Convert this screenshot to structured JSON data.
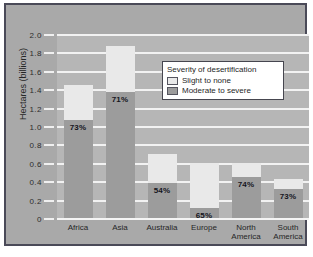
{
  "chart_data": {
    "type": "bar",
    "subtype": "stacked-bar",
    "title": "",
    "xlabel": "",
    "ylabel": "Hectares (billions)",
    "ylim": [
      0,
      2.0
    ],
    "ytick_values": [
      2.0,
      1.8,
      1.6,
      1.4,
      1.2,
      1.0,
      0.8,
      0.6,
      0.4,
      0.2,
      0
    ],
    "ytick_labels": [
      "2.0",
      "1.8",
      "1.6",
      "1.4",
      "1.2",
      "1.0",
      "0.8",
      "0.6",
      "0.4",
      "0.2",
      "0"
    ],
    "grid": true,
    "grid_orientation": "horizontal",
    "legend_position": "top-right-inside",
    "legend_title": "Severity of desertification",
    "categories": [
      "Africa",
      "Asia",
      "Australia",
      "Europe",
      "North America",
      "South America"
    ],
    "series": [
      {
        "name": "Moderate to severe",
        "color": "#9c9c9c",
        "values": [
          1.06,
          1.37,
          0.38,
          0.11,
          0.45,
          0.31
        ]
      },
      {
        "name": "Slight to none",
        "color": "#e9e9e9",
        "values": [
          0.39,
          0.5,
          0.32,
          0.49,
          0.15,
          0.11
        ]
      }
    ],
    "totals": [
      1.45,
      1.87,
      0.7,
      0.6,
      0.6,
      0.42
    ],
    "data_labels": [
      "73%",
      "71%",
      "54%",
      "65%",
      "74%",
      "73%"
    ],
    "data_label_note": "percent of total that is moderate to severe"
  },
  "axes": {
    "y_title": "Hectares (billions)",
    "y_ticks": [
      "2.0",
      "1.8",
      "1.6",
      "1.4",
      "1.2",
      "1.0",
      "0.8",
      "0.6",
      "0.4",
      "0.2",
      "0"
    ],
    "x_categories": [
      {
        "label": "Africa",
        "line1": "Africa",
        "line2": ""
      },
      {
        "label": "Asia",
        "line1": "Asia",
        "line2": ""
      },
      {
        "label": "Australia",
        "line1": "Australia",
        "line2": ""
      },
      {
        "label": "Europe",
        "line1": "Europe",
        "line2": ""
      },
      {
        "label": "North America",
        "line1": "North",
        "line2": "America"
      },
      {
        "label": "South America",
        "line1": "South",
        "line2": "America"
      }
    ]
  },
  "bars": [
    {
      "category": "Africa",
      "total": 1.45,
      "dark": 1.06,
      "light": 0.39,
      "pct": "73%"
    },
    {
      "category": "Asia",
      "total": 1.87,
      "dark": 1.37,
      "light": 0.5,
      "pct": "71%"
    },
    {
      "category": "Australia",
      "total": 0.7,
      "dark": 0.38,
      "light": 0.32,
      "pct": "54%"
    },
    {
      "category": "Europe",
      "total": 0.6,
      "dark": 0.11,
      "light": 0.49,
      "pct": "65%"
    },
    {
      "category": "North America",
      "total": 0.6,
      "dark": 0.45,
      "light": 0.15,
      "pct": "74%"
    },
    {
      "category": "South America",
      "total": 0.42,
      "dark": 0.31,
      "light": 0.11,
      "pct": "73%"
    }
  ],
  "legend": {
    "title": "Severity of desertification",
    "entries": [
      {
        "label": "Slight to none",
        "color": "#e9e9e9"
      },
      {
        "label": "Moderate to severe",
        "color": "#9c9c9c"
      }
    ]
  },
  "colors": {
    "figure_background": "#a9a9a9",
    "figure_border": "#4a4a58",
    "plot_background": "#b6b6b6",
    "gridline": "#f2f2f2",
    "slight_to_none": "#e9e9e9",
    "moderate_to_severe": "#9c9c9c",
    "text": "#262626",
    "legend_background": "#ffffff",
    "legend_border": "#46464f"
  }
}
